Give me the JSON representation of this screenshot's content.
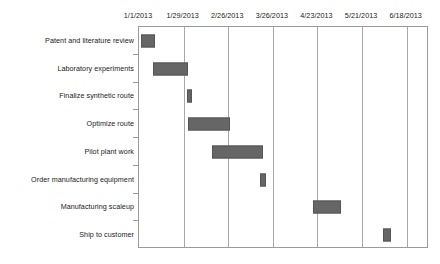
{
  "chart_data": {
    "type": "bar",
    "subtype": "gantt",
    "title": "",
    "xlabel": "",
    "ylabel": "",
    "grid": true,
    "legend": "none",
    "x_axis_position": "top",
    "x_tick_labels": [
      "1/1/2013",
      "1/29/2013",
      "2/26/2013",
      "3/26/2013",
      "4/23/2013",
      "5/21/2013",
      "6/18/2013"
    ],
    "x_tick_days": [
      0,
      28,
      56,
      84,
      112,
      140,
      168
    ],
    "xlim_days": [
      0,
      182
    ],
    "tick_interval_days": 28,
    "categories": [
      "Patent and literature review",
      "Laboratory experiments",
      "Finalize synthetic route",
      "Optimize route",
      "Pilot plant work",
      "Order manufacturing equipment",
      "Manufacturing scaleup",
      "Ship to customer"
    ],
    "bar_color": "#666666",
    "bar_edge_color": "#555555",
    "grid_color": "#a8a8a8",
    "frame_color": "#9a9a9a",
    "tasks": [
      {
        "name": "Patent and literature review",
        "start_day": 1,
        "end_day": 10,
        "duration_days": 9,
        "start_date": "1/2/2013",
        "end_date": "1/11/2013"
      },
      {
        "name": "Laboratory experiments",
        "start_day": 9,
        "end_day": 31,
        "duration_days": 22,
        "start_date": "1/10/2013",
        "end_date": "2/1/2013"
      },
      {
        "name": "Finalize synthetic route",
        "start_day": 30,
        "end_day": 33,
        "duration_days": 3,
        "start_date": "1/31/2013",
        "end_date": "2/3/2013"
      },
      {
        "name": "Optimize route",
        "start_day": 31,
        "end_day": 57,
        "duration_days": 26,
        "start_date": "2/1/2013",
        "end_date": "2/27/2013"
      },
      {
        "name": "Pilot plant work",
        "start_day": 46,
        "end_day": 78,
        "duration_days": 32,
        "start_date": "2/16/2013",
        "end_date": "3/20/2013"
      },
      {
        "name": "Order manufacturing equipment",
        "start_day": 76,
        "end_day": 80,
        "duration_days": 4,
        "start_date": "3/18/2013",
        "end_date": "3/22/2013"
      },
      {
        "name": "Manufacturing scaleup",
        "start_day": 109,
        "end_day": 127,
        "duration_days": 18,
        "start_date": "4/20/2013",
        "end_date": "5/8/2013"
      },
      {
        "name": "Ship to customer",
        "start_day": 153,
        "end_day": 158,
        "duration_days": 5,
        "start_date": "6/3/2013",
        "end_date": "6/8/2013"
      }
    ]
  }
}
